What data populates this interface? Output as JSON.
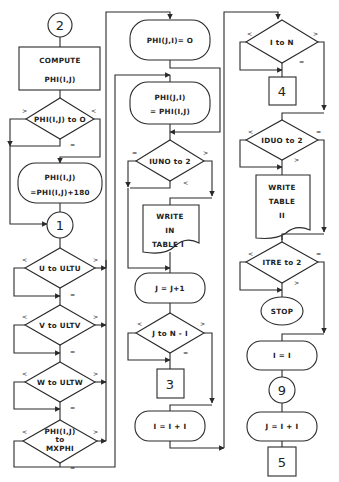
{
  "diagram": {
    "type": "flowchart",
    "colors": {
      "stroke": "#2a2a2a",
      "background": "#ffffff",
      "text": "#222222"
    },
    "column1": {
      "connector_start": "2",
      "compute_box": {
        "line1": "COMPUTE",
        "line2": "PHI(I,J)"
      },
      "decision_phi": {
        "text": "PHI(I,J) to O",
        "left": ">",
        "right": "<",
        "bottom": "="
      },
      "process_add180": {
        "line1": "PHI(I,J)",
        "line2": "=PHI(I,J)+180"
      },
      "connector_1": "1",
      "decision_u": {
        "text": "U to ULTU",
        "left": "<",
        "right": ">",
        "bottom": "="
      },
      "decision_v": {
        "text": "V to ULTV",
        "left": "<",
        "right": ">",
        "bottom": "="
      },
      "decision_w": {
        "text": "W to ULTW",
        "left": "<",
        "right": ">",
        "bottom": "="
      },
      "decision_mxphi": {
        "line1": "PHI(I,J)",
        "line2": "to",
        "line3": "MXPHI",
        "left": "<",
        "right": ">",
        "bottom": "="
      }
    },
    "column2": {
      "process_phi_ji_zero": "PHI(J,I)= O",
      "process_phi_ji_assign": {
        "line1": "PHI(J,I)",
        "line2": "= PHI(I,J)"
      },
      "decision_iuno": {
        "text": "IUNO to 2",
        "left": "=",
        "right": ">",
        "bottom": "<"
      },
      "document_write1": {
        "line1": "WRITE",
        "line2": "IN",
        "line3": "TABLE I"
      },
      "process_j_inc": "J = J+1",
      "decision_j": {
        "text": "J to N - I",
        "left": "<",
        "right": ">",
        "bottom": "="
      },
      "offpage_3": "3",
      "process_i_inc": "I = I + I"
    },
    "column3": {
      "decision_i": {
        "text": "I to N",
        "left": "<",
        "right": ">",
        "bottom": "="
      },
      "offpage_4": "4",
      "decision_iduo": {
        "text": "IDUO to 2",
        "left": "<",
        "right": "=",
        "bottom": ">"
      },
      "document_write2": {
        "line1": "WRITE",
        "line2": "TABLE",
        "line3": "II"
      },
      "decision_itre": {
        "text": "ITRE to 2",
        "left": "<",
        "right": "=",
        "bottom": ">"
      },
      "terminal_stop": "STOP",
      "process_i_one": "I = I",
      "connector_9": "9",
      "process_j_assign": "J = I + I",
      "offpage_5": "5"
    }
  }
}
